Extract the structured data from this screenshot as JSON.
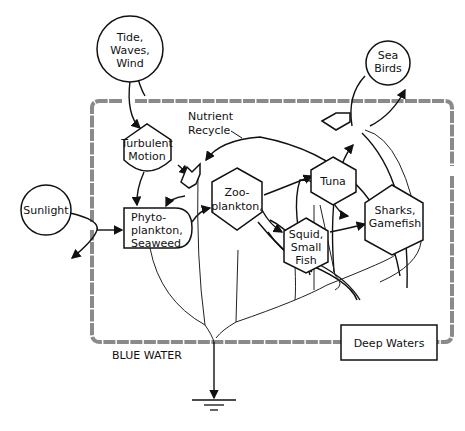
{
  "diagram": {
    "type": "energy-systems-diagram",
    "boundary_label": "BLUE WATER",
    "annotation": {
      "line1": "Nutrient",
      "line2": "Recycle"
    },
    "sources": [
      {
        "id": "tide",
        "lines": [
          "Tide,",
          "Waves,",
          "Wind"
        ]
      },
      {
        "id": "sunlight",
        "lines": [
          "Sunlight"
        ]
      },
      {
        "id": "seabirds",
        "lines": [
          "Sea",
          "Birds"
        ]
      }
    ],
    "nodes": [
      {
        "id": "turbulent",
        "lines": [
          "Turbulent",
          "Motion"
        ]
      },
      {
        "id": "phyto",
        "lines": [
          "Phyto-",
          "plankton,",
          "Seaweed"
        ]
      },
      {
        "id": "zoo",
        "lines": [
          "Zoo-",
          "plankton,"
        ]
      },
      {
        "id": "tuna",
        "lines": [
          "Tuna"
        ]
      },
      {
        "id": "squid",
        "lines": [
          "Squid,",
          "Small",
          "Fish"
        ]
      },
      {
        "id": "sharks",
        "lines": [
          "Sharks,",
          "Gamefish"
        ]
      },
      {
        "id": "deep",
        "lines": [
          "Deep Waters"
        ]
      }
    ],
    "colors": {
      "line": "#111111",
      "boundary": "#8a8a8a",
      "background": "#ffffff"
    }
  }
}
